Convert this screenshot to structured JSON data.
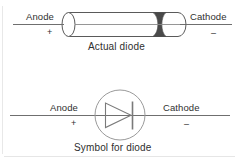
{
  "figure": {
    "background_color": "#ffffff",
    "line_color": "#6b6b6b",
    "stroke_color": "#555555",
    "band_color": "#4a4a4a",
    "text_color": "#2f2f2f"
  },
  "actual_diode": {
    "anode_label": "Anode",
    "anode_sign": "+",
    "cathode_label": "Cathode",
    "cathode_sign": "–",
    "caption": "Actual diode"
  },
  "diode_symbol": {
    "anode_label": "Anode",
    "anode_sign": "+",
    "cathode_label": "Cathode",
    "cathode_sign": "–",
    "caption": "Symbol for diode"
  }
}
